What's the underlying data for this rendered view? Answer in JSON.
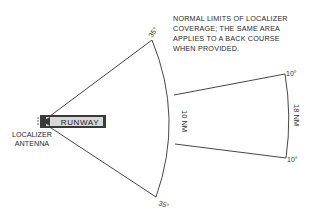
{
  "diagram": {
    "note_lines": [
      "NORMAL LIMITS OF LOCALIZER",
      "COVERAGE; THE SAME AREA",
      "APPLIES TO A BACK COURSE",
      "WHEN PROVIDED."
    ],
    "runway_label": "RUNWAY",
    "antenna_label_lines": [
      "LOCALIZER",
      "ANTENNA"
    ],
    "angles": {
      "upper_wide": "35°",
      "lower_wide": "35°",
      "upper_narrow": "10°",
      "lower_narrow": "10°"
    },
    "distances": {
      "inner_arc": "10 NM",
      "outer_arc": "18 NM"
    },
    "colors": {
      "line": "#333333",
      "runway_fill": "#3a3a3a",
      "runway_text_bg": "#d8d8d8"
    }
  }
}
